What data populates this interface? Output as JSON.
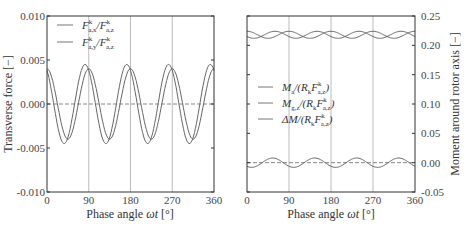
{
  "chart_data": [
    {
      "type": "line",
      "title": "",
      "xlabel": "Phase angle ωt [°]",
      "ylabel": "Transverse force [−]",
      "xlim": [
        0,
        360
      ],
      "ylim": [
        -0.01,
        0.01
      ],
      "xticks": [
        "0",
        "90",
        "180",
        "270",
        "360"
      ],
      "yticks": [
        "0.010",
        "0.005",
        "0.000",
        "-0.005",
        "-0.010"
      ],
      "grid": "vertical lines at 90, 180, 270",
      "legend_position": "upper left",
      "reference_line": {
        "y": 0.0,
        "style": "dashed"
      },
      "series": [
        {
          "name": "F^k_a,x / F^k_a,z",
          "form": "sinusoid",
          "period_deg": 90,
          "amplitude": 0.0045,
          "mean": 0.0,
          "peak_at_deg": 82,
          "x": [
            0,
            15,
            30,
            37,
            45,
            60,
            75,
            82,
            90
          ],
          "values": [
            0.0008,
            -0.003,
            -0.0044,
            -0.0045,
            -0.004,
            -0.0008,
            0.0039,
            0.0045,
            0.004
          ]
        },
        {
          "name": "F^k_a,y / F^k_a,z",
          "form": "sinusoid",
          "period_deg": 90,
          "amplitude": 0.004,
          "mean": 0.0,
          "peak_at_deg": 90,
          "x": [
            0,
            15,
            30,
            45,
            60,
            75,
            90
          ],
          "values": [
            0.004,
            0.002,
            -0.002,
            -0.004,
            -0.002,
            0.002,
            0.004
          ]
        }
      ]
    },
    {
      "type": "line",
      "title": "",
      "xlabel": "Phase angle ωt [°]",
      "ylabel": "Moment around rotor axis [−]",
      "xlim": [
        0,
        360
      ],
      "ylim": [
        -0.05,
        0.25
      ],
      "xticks": [
        "0",
        "90",
        "180",
        "270",
        "360"
      ],
      "yticks": [
        "0.25",
        "0.20",
        "0.15",
        "0.10",
        "0.05",
        "0.00",
        "-0.05"
      ],
      "grid": "vertical lines at 90, 180, 270",
      "legend_position": "center left",
      "reference_line": {
        "y": 0.0,
        "style": "dashed"
      },
      "series": [
        {
          "name": "M_a / (R_k F^k_a,z)",
          "form": "sinusoid",
          "period_deg": 90,
          "amplitude": 0.006,
          "mean": 0.218,
          "peak_at_deg": 0,
          "x": [
            0,
            22.5,
            45,
            67.5,
            90
          ],
          "values": [
            0.224,
            0.218,
            0.212,
            0.218,
            0.224
          ]
        },
        {
          "name": "M_g,z / (R_k F^k_a,z)",
          "form": "sinusoid",
          "period_deg": 90,
          "amplitude": 0.006,
          "mean": 0.218,
          "peak_at_deg": 60,
          "x": [
            0,
            15,
            45,
            60,
            90
          ],
          "values": [
            0.213,
            0.212,
            0.221,
            0.224,
            0.213
          ]
        },
        {
          "name": "ΔM / (R_k F^k_a,z)",
          "form": "sinusoid",
          "period_deg": 90,
          "amplitude": 0.008,
          "mean": 0.0,
          "peak_at_deg": 55,
          "x": [
            0,
            10,
            55,
            90
          ],
          "values": [
            -0.007,
            -0.008,
            0.008,
            -0.007
          ]
        }
      ]
    }
  ],
  "left": {
    "ylabel": "Transverse force [−]",
    "xlabel": "Phase angle ωt [°]",
    "yticks": [
      "0.010",
      "0.005",
      "0.000",
      "-0.005",
      "-0.010"
    ],
    "xticks": [
      "0",
      "90",
      "180",
      "270",
      "360"
    ],
    "legend": [
      "F",
      "F"
    ]
  },
  "right": {
    "ylabel": "Moment around rotor axis [−]",
    "xlabel": "Phase angle ωt [°]",
    "yticks": [
      "0.25",
      "0.20",
      "0.15",
      "0.10",
      "0.05",
      "0.00",
      "-0.05"
    ],
    "xticks": [
      "0",
      "90",
      "180",
      "270",
      "360"
    ]
  }
}
